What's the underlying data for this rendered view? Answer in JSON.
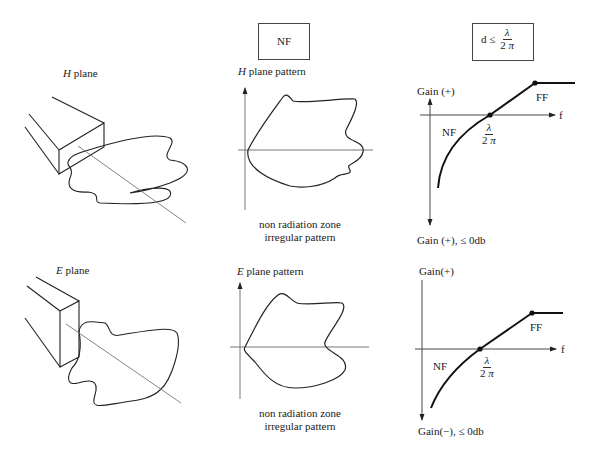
{
  "top_box": {
    "label": "NF"
  },
  "condition_box": {
    "lhs": "d ≤",
    "numerator": "λ",
    "denominator_num": "2",
    "denominator_sym": "π"
  },
  "rows": [
    {
      "waveguide_label_italic": "H",
      "waveguide_label_rest": "plane",
      "pattern_label_italic": "H",
      "pattern_label_rest": "plane pattern",
      "caption_line1": "non radiation zone",
      "caption_line2": "irregular pattern",
      "gain_top_label": "Gain (+)",
      "gain_bottom_label": "Gain (+), ≤ 0db",
      "f_label": "f",
      "nf_label": "NF",
      "ff_label": "FF",
      "crossing_numerator": "λ",
      "crossing_denominator_num": "2",
      "crossing_denominator_sym": "π"
    },
    {
      "waveguide_label_italic": "E",
      "waveguide_label_rest": "plane",
      "pattern_label_italic": "E",
      "pattern_label_rest": "plane pattern",
      "caption_line1": "non radiation zone",
      "caption_line2": "irregular pattern",
      "gain_top_label": "Gain(+)",
      "gain_bottom_label": "Gain(−), ≤ 0db",
      "f_label": "f",
      "nf_label": "NF",
      "ff_label": "FF",
      "crossing_numerator": "λ",
      "crossing_denominator_num": "2",
      "crossing_denominator_sym": "π"
    }
  ]
}
